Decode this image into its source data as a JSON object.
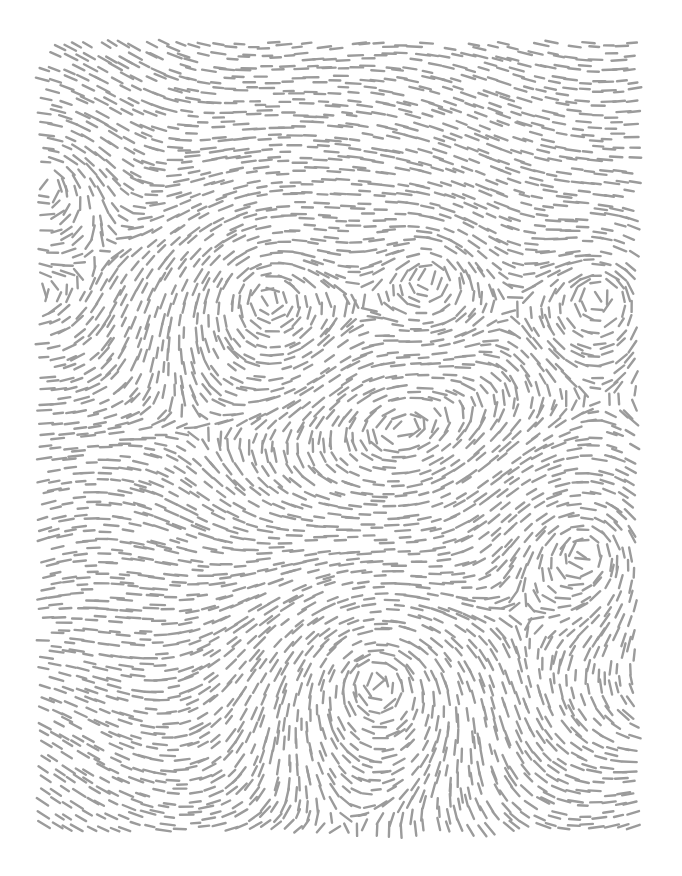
{
  "artwork": {
    "type": "flow-field-dash-pattern",
    "background": "#ffffff",
    "stroke_color": "#9b9b9b",
    "stroke_width": 2.4,
    "dash_length": 12,
    "grid_spacing": 11.5,
    "frame": {
      "x": 42,
      "y": 42,
      "width": 598,
      "height": 792
    },
    "vortices": [
      {
        "x": 268,
        "y": 297,
        "strength": 1.0,
        "radius": 95
      },
      {
        "x": 430,
        "y": 275,
        "strength": 1.0,
        "radius": 90
      },
      {
        "x": 600,
        "y": 295,
        "strength": 1.0,
        "radius": 85
      },
      {
        "x": 585,
        "y": 550,
        "strength": 1.0,
        "radius": 90
      },
      {
        "x": 375,
        "y": 680,
        "strength": 1.0,
        "radius": 100
      },
      {
        "x": 45,
        "y": 185,
        "strength": 1.0,
        "radius": 70
      }
    ],
    "base_flow_angle_deg": 8
  }
}
